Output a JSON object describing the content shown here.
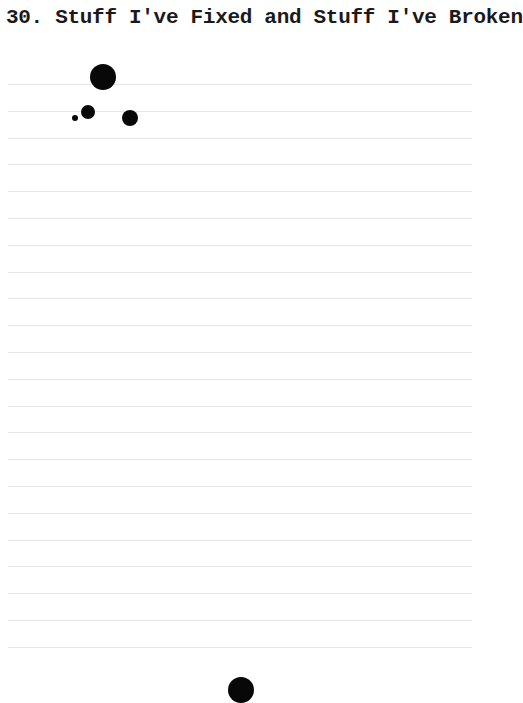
{
  "page": {
    "title": "30. Stuff I've Fixed and Stuff I've Broken",
    "ruled_lines": {
      "count": 22,
      "start_y": 84,
      "spacing": 26.8,
      "color": "#e6e6e6"
    },
    "ink_blots": [
      {
        "x": 103,
        "y": 77,
        "r": 13
      },
      {
        "x": 88,
        "y": 112,
        "r": 7
      },
      {
        "x": 75,
        "y": 118,
        "r": 3
      },
      {
        "x": 130,
        "y": 118,
        "r": 8
      },
      {
        "x": 241,
        "y": 690,
        "r": 13
      }
    ],
    "ink_color": "#080808"
  }
}
